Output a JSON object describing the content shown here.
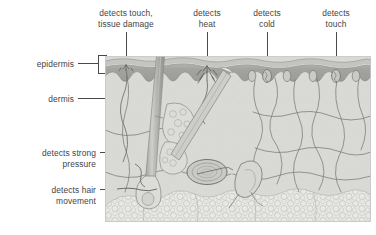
{
  "figure": {
    "type": "labelled-anatomical-diagram",
    "palette": {
      "background": "#ffffff",
      "text": "#444444",
      "leader_line": "#4a4a4a",
      "epidermis": "#a6a6a6",
      "epidermis_surface": "#b9b9b9",
      "epidermis_highlight": "#e8e8e6",
      "dermis": "#d9d9d6",
      "adipose": "#e6e6e3",
      "nerve": "#6f6f6f",
      "hair": "#b0b0ad",
      "corpuscle": "#bdbdba"
    }
  },
  "layer_labels": [
    {
      "id": "epidermis",
      "text": "epidermis",
      "align": "right"
    },
    {
      "id": "dermis",
      "text": "dermis",
      "align": "right"
    }
  ],
  "receptor_labels": [
    {
      "id": "free-nerve-ending",
      "text": "detects touch,\ntissue damage",
      "align": "center",
      "position": "top"
    },
    {
      "id": "heat-receptor",
      "text": "detects\nheat",
      "align": "center",
      "position": "top"
    },
    {
      "id": "cold-receptor",
      "text": "detects\ncold",
      "align": "center",
      "position": "top"
    },
    {
      "id": "touch-receptor",
      "text": "detects\ntouch",
      "align": "center",
      "position": "top"
    },
    {
      "id": "pacinian-corpuscle",
      "text": "detects strong\npressure",
      "align": "right",
      "position": "left"
    },
    {
      "id": "hair-follicle-receptor",
      "text": "detects hair\nmovement",
      "align": "right",
      "position": "left"
    }
  ],
  "structures": [
    {
      "id": "hair-shaft",
      "name": "hair shaft"
    },
    {
      "id": "hair-follicle",
      "name": "hair follicle"
    },
    {
      "id": "sebaceous-gland",
      "name": "sebaceous gland"
    },
    {
      "id": "sweat-gland-duct",
      "name": "sweat gland duct"
    },
    {
      "id": "pacinian-corpuscle-body",
      "name": "pacinian corpuscle"
    },
    {
      "id": "adipose-tissue",
      "name": "fatty (adipose) tissue"
    },
    {
      "id": "nerve-fibre-network",
      "name": "nerve fibre network"
    }
  ]
}
